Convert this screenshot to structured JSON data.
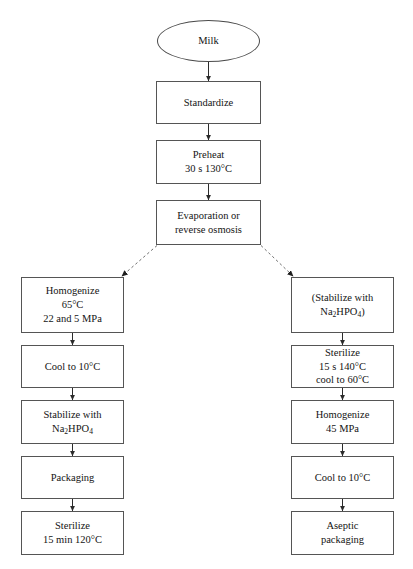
{
  "diagram": {
    "type": "flowchart",
    "orientation": "top-down with two parallel branches",
    "colors": {
      "stroke": "#555555",
      "text": "#141414",
      "background": "#ffffff",
      "branch_line": "#7a7a7a"
    },
    "start": {
      "id": "milk",
      "shape": "ellipse",
      "label": "Milk"
    },
    "trunk": [
      {
        "id": "standardize",
        "shape": "rect",
        "lines": [
          "Standardize"
        ]
      },
      {
        "id": "preheat",
        "shape": "rect",
        "lines": [
          "Preheat",
          "30 s 130°C"
        ]
      },
      {
        "id": "evaporation",
        "shape": "rect",
        "lines": [
          "Evaporation or",
          "reverse osmosis"
        ]
      }
    ],
    "left_branch": {
      "name": "In-container sterilization branch",
      "steps": [
        {
          "id": "left-homogenize",
          "shape": "rect",
          "lines": [
            "Homogenize",
            "65°C",
            "22 and 5 MPa"
          ]
        },
        {
          "id": "left-cool",
          "shape": "rect",
          "lines": [
            "Cool to 10°C"
          ]
        },
        {
          "id": "left-stabilize",
          "shape": "rect",
          "lines": [
            "Stabilize with",
            "Na<sub>2</sub>HPO<sub>4</sub>"
          ]
        },
        {
          "id": "left-packaging",
          "shape": "rect",
          "lines": [
            "Packaging"
          ]
        },
        {
          "id": "left-sterilize",
          "shape": "rect",
          "lines": [
            "Sterilize",
            "15 min 120°C"
          ]
        }
      ]
    },
    "right_branch": {
      "name": "UHT aseptic branch",
      "steps": [
        {
          "id": "right-stabilize",
          "shape": "rect",
          "lines": [
            "(Stabilize with",
            "Na<sub>2</sub>HPO<sub>4</sub>)"
          ]
        },
        {
          "id": "right-sterilize",
          "shape": "rect",
          "lines": [
            "Sterilize",
            "15 s 140°C",
            "cool to 60°C"
          ]
        },
        {
          "id": "right-homogenize",
          "shape": "rect",
          "lines": [
            "Homogenize",
            "45 MPa"
          ]
        },
        {
          "id": "right-cool",
          "shape": "rect",
          "lines": [
            "Cool to 10°C"
          ]
        },
        {
          "id": "right-aseptic",
          "shape": "rect",
          "lines": [
            "Aseptic",
            "packaging"
          ]
        }
      ]
    },
    "connectors": {
      "solid_arrows": 11,
      "dashed_arrows": 2,
      "dashed_from": "evaporation",
      "dashed_to": [
        "left-homogenize",
        "right-stabilize"
      ]
    }
  }
}
